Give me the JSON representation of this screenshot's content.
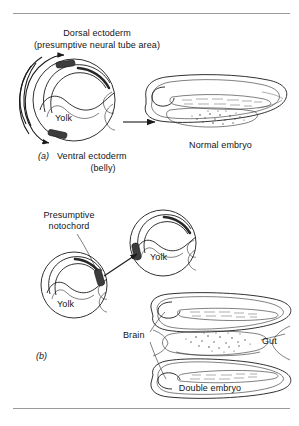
{
  "figure": {
    "title_visible": false,
    "panels": [
      {
        "tag": "(a)",
        "labels": {
          "dorsal_line1": "Dorsal ectoderm",
          "dorsal_line2": "(presumptive neural tube area)",
          "yolk": "Yolk",
          "ventral_line1": "Ventral ectoderm",
          "ventral_line2": "(belly)",
          "result": "Normal embryo"
        }
      },
      {
        "tag": "(b)",
        "labels": {
          "notochord_line1": "Presumptive",
          "notochord_line2": "notochord",
          "yolk_donor": "Yolk",
          "yolk_host": "Yolk",
          "brain": "Brain",
          "gut": "Gut",
          "result": "Double embryo"
        }
      }
    ],
    "icons": {
      "rotation_arrow": "curved-arrow-icon",
      "transform_arrow": "right-arrow-icon",
      "transplant_arrow": "diagonal-arrow-icon",
      "graft_marker": "graft-bar-icon"
    },
    "colors": {
      "ink": "#1a1a1a",
      "graft": "#3d3d3d",
      "rule": "#9a9a9a",
      "background": "#ffffff"
    }
  }
}
